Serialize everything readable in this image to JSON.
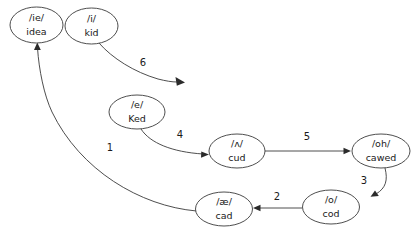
{
  "diagram": {
    "background_color": "#ffffff",
    "stroke_color": "#3a3a3a",
    "text_color": "#1a1a1a",
    "nodes": [
      {
        "id": "idea",
        "phoneme": "/ie/",
        "word": "idea",
        "cx": 36.5,
        "cy": 25,
        "rx": 26.5,
        "ry": 18
      },
      {
        "id": "kid",
        "phoneme": "/i/",
        "word": "kid",
        "cx": 91.5,
        "cy": 26,
        "rx": 26.5,
        "ry": 18
      },
      {
        "id": "ked",
        "phoneme": "/e/",
        "word": "Ked",
        "cx": 137,
        "cy": 112,
        "rx": 28,
        "ry": 17
      },
      {
        "id": "cud",
        "phoneme": "/ʌ/",
        "word": "cud",
        "cx": 237,
        "cy": 151,
        "rx": 28,
        "ry": 17
      },
      {
        "id": "cawed",
        "phoneme": "/oh/",
        "word": "cawed",
        "cx": 381,
        "cy": 151,
        "rx": 29,
        "ry": 17
      },
      {
        "id": "cod",
        "phoneme": "/o/",
        "word": "cod",
        "cx": 331,
        "cy": 207,
        "rx": 28.5,
        "ry": 17
      },
      {
        "id": "cad",
        "phoneme": "/æ/",
        "word": "cad",
        "cx": 224,
        "cy": 209,
        "rx": 28.5,
        "ry": 17
      }
    ],
    "edges": [
      {
        "id": "edge-1",
        "label": "1",
        "from": "cad",
        "to": "idea",
        "label_x": 110,
        "label_y": 148
      },
      {
        "id": "edge-2",
        "label": "2",
        "from": "cod",
        "to": "cad",
        "label_x": 277,
        "label_y": 197
      },
      {
        "id": "edge-3",
        "label": "3",
        "from": "cawed",
        "to": "cod",
        "label_x": 364,
        "label_y": 181
      },
      {
        "id": "edge-4",
        "label": "4",
        "from": "ked",
        "to": "cud",
        "label_x": 180,
        "label_y": 135
      },
      {
        "id": "edge-5",
        "label": "5",
        "from": "cud",
        "to": "cawed",
        "label_x": 307,
        "label_y": 137
      },
      {
        "id": "edge-6",
        "label": "6",
        "from": "kid",
        "to": "",
        "label_x": 143,
        "label_y": 63
      }
    ]
  }
}
